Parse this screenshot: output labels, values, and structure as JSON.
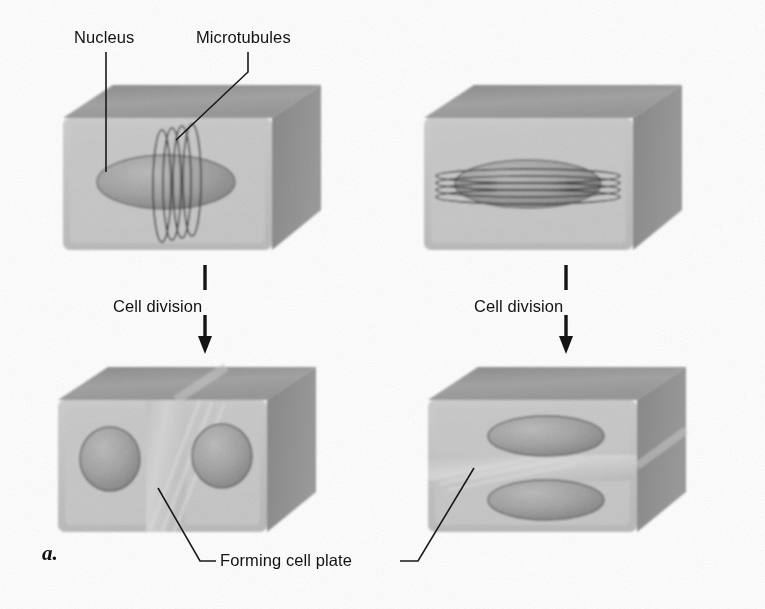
{
  "figure": {
    "part_label": "a.",
    "background_color": "#fefefe",
    "line_color": "#1a1a1a",
    "text_color": "#121212"
  },
  "labels": {
    "nucleus": "Nucleus",
    "microtubules": "Microtubules",
    "cell_division_left": "Cell division",
    "cell_division_right": "Cell division",
    "forming_cell_plate": "Forming cell plate"
  },
  "cells": {
    "top_left": {
      "name": "cell-before-division-transverse-band",
      "nucleus_shape": "ellipse-horizontal",
      "microtubule_orientation": "vertical-rings",
      "microtubule_ring_count": 4
    },
    "top_right": {
      "name": "cell-before-division-longitudinal-band",
      "nucleus_shape": "ellipse-horizontal-flat",
      "microtubule_orientation": "horizontal-bands",
      "microtubule_ring_count": 4
    },
    "bottom_left": {
      "name": "cell-after-division-vertical-plate",
      "nuclei_count": 2,
      "nuclei_arrangement": "side-by-side",
      "cell_plate_orientation": "vertical"
    },
    "bottom_right": {
      "name": "cell-after-division-horizontal-plate",
      "nuclei_count": 2,
      "nuclei_arrangement": "stacked",
      "cell_plate_orientation": "horizontal"
    }
  },
  "colors": {
    "box_top_face": "#9a9a9a",
    "box_front_face": "#c9c9c9",
    "box_side_face": "#8d8d8d",
    "box_inner_face": "#bdbdbd",
    "nucleus_fill": "#9e9e9e",
    "nucleus_edge": "#5e5e5e",
    "microtubule_stroke": "#3c3c3c",
    "cell_plate": "#d2d2d2"
  }
}
